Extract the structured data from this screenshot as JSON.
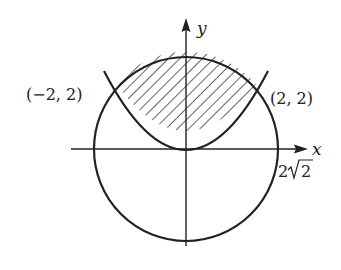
{
  "figure": {
    "type": "region-diagram",
    "colors": {
      "stroke": "#222222",
      "background": "#ffffff"
    },
    "axes": {
      "x_label": "x",
      "y_label": "y"
    },
    "labels": {
      "left_point": "(−2, 2)",
      "right_point": "(2, 2)",
      "radius_num": "2",
      "radius_rad": "2"
    },
    "curves": [
      {
        "name": "circle",
        "equation": "x^2 + y^2 = 8",
        "radius": "2√2"
      },
      {
        "name": "parabola",
        "equation": "x^2 = 2y"
      }
    ],
    "intersections": [
      {
        "x": -2,
        "y": 2
      },
      {
        "x": 2,
        "y": 2
      }
    ],
    "shaded_region": "bounded above by circle, below by parabola, between x=-2 and x=2"
  }
}
